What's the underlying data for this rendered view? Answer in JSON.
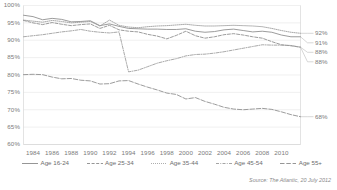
{
  "chart_data": {
    "type": "line",
    "title": "",
    "xlabel": "",
    "ylabel": "",
    "ylim": [
      60,
      100
    ],
    "xlim": [
      1983,
      2012
    ],
    "grid": true,
    "grid_axis": "y",
    "legend_position": "bottom",
    "ytick_labels": [
      "100%",
      "95%",
      "90%",
      "85%",
      "80%",
      "75%",
      "70%",
      "65%",
      "60%"
    ],
    "ytick_values": [
      100,
      95,
      90,
      85,
      80,
      75,
      70,
      65,
      60
    ],
    "xtick_labels": [
      "1984",
      "1986",
      "1988",
      "1990",
      "1992",
      "1994",
      "1996",
      "1998",
      "2000",
      "2002",
      "2004",
      "2006",
      "2008",
      "2010"
    ],
    "xtick_values": [
      1984,
      1986,
      1988,
      1990,
      1992,
      1994,
      1996,
      1998,
      2000,
      2002,
      2004,
      2006,
      2008,
      2010
    ],
    "x": [
      1983,
      1984,
      1985,
      1986,
      1987,
      1988,
      1989,
      1990,
      1991,
      1992,
      1993,
      1994,
      1995,
      1996,
      1997,
      1998,
      1999,
      2000,
      2001,
      2002,
      2003,
      2004,
      2005,
      2006,
      2007,
      2008,
      2009,
      2010,
      2011,
      2012
    ],
    "series": [
      {
        "name": "Age 16-24",
        "style": "solid",
        "color": "#8a8a8a",
        "end_label": "91%",
        "values": [
          97.2,
          96.8,
          95.9,
          96.3,
          96.0,
          95.3,
          95.4,
          95.6,
          94.2,
          94.7,
          94.0,
          93.4,
          93.3,
          93.2,
          93.2,
          93.1,
          93.1,
          93.3,
          92.6,
          92.3,
          92.5,
          93.0,
          93.2,
          92.8,
          92.4,
          92.6,
          92.3,
          91.5,
          91.0,
          91.0
        ]
      },
      {
        "name": "Age 25-34",
        "style": "dashed",
        "color": "#8a8a8a",
        "end_label": "88%",
        "values": [
          95.7,
          95.0,
          94.5,
          95.1,
          94.6,
          94.2,
          94.5,
          94.7,
          93.4,
          94.3,
          93.0,
          92.6,
          92.4,
          91.7,
          91.2,
          90.4,
          91.4,
          92.6,
          91.3,
          90.6,
          91.0,
          91.6,
          91.9,
          91.5,
          91.0,
          90.6,
          89.6,
          88.7,
          88.4,
          88.0
        ]
      },
      {
        "name": "Age 35-44",
        "style": "dotted",
        "color": "#9a9a9a",
        "end_label": "92%",
        "values": [
          95.8,
          95.5,
          95.2,
          95.7,
          95.4,
          95.0,
          95.2,
          95.4,
          94.1,
          95.8,
          94.3,
          93.8,
          93.6,
          93.9,
          94.1,
          94.2,
          94.4,
          94.6,
          94.3,
          94.1,
          94.1,
          94.2,
          94.3,
          94.2,
          94.1,
          93.9,
          93.4,
          92.8,
          92.3,
          92.0
        ]
      },
      {
        "name": "Age 45-54",
        "style": "dashdot",
        "color": "#9a9a9a",
        "end_label": "88%",
        "values": [
          91.0,
          91.3,
          91.6,
          92.0,
          92.4,
          92.7,
          93.1,
          92.6,
          92.3,
          92.1,
          92.4,
          80.9,
          81.4,
          82.4,
          83.4,
          84.1,
          84.7,
          85.5,
          85.9,
          86.0,
          86.3,
          86.7,
          87.2,
          87.7,
          88.2,
          88.7,
          88.6,
          88.6,
          88.5,
          88.0
        ]
      },
      {
        "name": "Age 55+",
        "style": "longdash",
        "color": "#8a8a8a",
        "end_label": "68%",
        "values": [
          80.1,
          80.2,
          80.1,
          79.4,
          78.9,
          79.0,
          78.5,
          78.3,
          77.4,
          77.5,
          78.3,
          78.4,
          77.4,
          76.5,
          75.7,
          74.8,
          74.4,
          73.1,
          73.5,
          72.4,
          71.6,
          70.7,
          70.2,
          70.0,
          70.2,
          70.4,
          70.1,
          69.4,
          68.6,
          68.0
        ]
      }
    ]
  },
  "source": {
    "text": "Source: The Atlantic, 20 July 2012"
  }
}
